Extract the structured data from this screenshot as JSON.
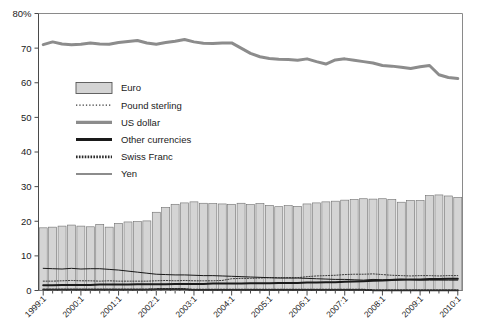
{
  "chart_data": {
    "type": "bar",
    "title": "",
    "subtitle": "",
    "xlabel": "",
    "ylabel": "",
    "ylim": [
      0,
      80
    ],
    "ytick_values": [
      0,
      10,
      20,
      30,
      40,
      50,
      60,
      70,
      80
    ],
    "ytick_labels": [
      "0",
      "10",
      "20",
      "30",
      "40",
      "50",
      "60",
      "70",
      "80%"
    ],
    "grid": false,
    "legend_position": "upper-left-inside",
    "legend": [
      {
        "label": "Euro",
        "marker": "filled-bar",
        "color": "#d4d4d4"
      },
      {
        "label": "Pound sterling",
        "marker": "dotted-thin-line",
        "color": "#3a3a3a"
      },
      {
        "label": "US dollar",
        "marker": "thick-gray-line",
        "color": "#8c8c8c"
      },
      {
        "label": "Other currencies",
        "marker": "thick-black-line",
        "color": "#1a1a1a"
      },
      {
        "label": "Swiss Franc",
        "marker": "dotted-thick-line",
        "color": "#2b2b2b"
      },
      {
        "label": "Yen",
        "marker": "thin-black-line",
        "color": "#1a1a1a"
      }
    ],
    "x": [
      "1999:1",
      "1999:2",
      "1999:3",
      "1999:4",
      "2000:1",
      "2000:2",
      "2000:3",
      "2000:4",
      "2001:1",
      "2001:2",
      "2001:3",
      "2001:4",
      "2002:1",
      "2002:2",
      "2002:3",
      "2002:4",
      "2003:1",
      "2003:2",
      "2003:3",
      "2003:4",
      "2004:1",
      "2004:2",
      "2004:3",
      "2004:4",
      "2005:1",
      "2005:2",
      "2005:3",
      "2005:4",
      "2006:1",
      "2006:2",
      "2006:3",
      "2006:4",
      "2007:1",
      "2007:2",
      "2007:3",
      "2007:4",
      "2008:1",
      "2008:2",
      "2008:3",
      "2008:4",
      "2009:1",
      "2009:2",
      "2009:3",
      "2009:4",
      "2010:1"
    ],
    "xtick_labels": [
      "1999:1",
      "2000:1",
      "2001:1",
      "2002:1",
      "2003:1",
      "2004:1",
      "2005:1",
      "2006:1",
      "2007:1",
      "2008:1",
      "2009:1",
      "2010:1"
    ],
    "xtick_label_rotation": -45,
    "series": [
      {
        "name": "Euro",
        "kind": "bar",
        "color": "#d4d4d4",
        "values": [
          18.1,
          18.3,
          18.6,
          18.9,
          18.6,
          18.4,
          19.1,
          18.3,
          19.4,
          19.8,
          19.9,
          20.1,
          22.6,
          24.0,
          24.9,
          25.3,
          25.6,
          25.2,
          25.1,
          25.0,
          24.9,
          25.2,
          24.8,
          25.1,
          24.6,
          24.2,
          24.5,
          24.3,
          25.0,
          25.3,
          25.6,
          25.8,
          26.1,
          26.3,
          26.5,
          26.4,
          26.5,
          26.3,
          25.5,
          26.0,
          26.0,
          27.4,
          27.6,
          27.3,
          26.9
        ]
      },
      {
        "name": "Pound sterling",
        "kind": "line",
        "color": "#3a3a3a",
        "style": "dotted",
        "width": 1,
        "values": [
          2.7,
          2.7,
          2.8,
          2.9,
          2.8,
          2.8,
          2.7,
          2.8,
          2.7,
          2.7,
          2.7,
          2.7,
          2.8,
          2.9,
          2.8,
          2.9,
          2.8,
          2.8,
          2.8,
          2.9,
          3.4,
          3.5,
          3.5,
          3.6,
          3.7,
          3.7,
          3.7,
          3.7,
          4.0,
          4.2,
          4.3,
          4.4,
          4.6,
          4.7,
          4.7,
          4.8,
          4.6,
          4.4,
          4.3,
          4.2,
          4.3,
          4.3,
          4.2,
          4.3,
          4.3
        ]
      },
      {
        "name": "US dollar",
        "kind": "line",
        "color": "#8c8c8c",
        "style": "solid",
        "width": 3,
        "values": [
          71.0,
          71.8,
          71.2,
          71.0,
          71.1,
          71.5,
          71.2,
          71.1,
          71.6,
          71.9,
          72.2,
          71.5,
          71.1,
          71.6,
          72.0,
          72.5,
          71.8,
          71.4,
          71.3,
          71.5,
          71.5,
          70.0,
          68.5,
          67.5,
          67.0,
          66.8,
          66.7,
          66.5,
          66.9,
          66.1,
          65.4,
          66.6,
          66.9,
          66.5,
          66.1,
          65.7,
          65.0,
          64.8,
          64.5,
          64.1,
          64.6,
          65.0,
          62.3,
          61.5,
          61.2
        ]
      },
      {
        "name": "Other currencies",
        "kind": "line",
        "color": "#1a1a1a",
        "style": "solid",
        "width": 2,
        "values": [
          1.5,
          1.5,
          1.6,
          1.6,
          1.6,
          1.6,
          1.7,
          1.7,
          1.7,
          1.7,
          1.8,
          1.8,
          1.8,
          1.8,
          1.9,
          1.9,
          1.9,
          1.9,
          2.0,
          2.0,
          2.0,
          2.0,
          2.1,
          2.1,
          2.1,
          2.2,
          2.2,
          2.2,
          2.3,
          2.3,
          2.4,
          2.4,
          2.5,
          2.6,
          2.7,
          2.8,
          2.9,
          3.0,
          3.1,
          3.2,
          3.2,
          3.3,
          3.3,
          3.4,
          3.4
        ]
      },
      {
        "name": "Swiss Franc",
        "kind": "line",
        "color": "#2b2b2b",
        "style": "dotted",
        "width": 2,
        "values": [
          0.3,
          0.3,
          0.3,
          0.3,
          0.3,
          0.3,
          0.3,
          0.3,
          0.3,
          0.3,
          0.3,
          0.3,
          0.4,
          0.4,
          0.4,
          0.4,
          0.2,
          0.2,
          0.2,
          0.2,
          0.2,
          0.2,
          0.2,
          0.2,
          0.2,
          0.2,
          0.2,
          0.2,
          0.2,
          0.2,
          0.2,
          0.2,
          0.2,
          0.2,
          0.2,
          0.1,
          0.1,
          0.1,
          0.1,
          0.1,
          0.1,
          0.1,
          0.1,
          0.1,
          0.1
        ]
      },
      {
        "name": "Yen",
        "kind": "line",
        "color": "#1a1a1a",
        "style": "solid",
        "width": 1,
        "values": [
          6.4,
          6.3,
          6.2,
          6.4,
          6.2,
          6.3,
          6.3,
          6.1,
          5.9,
          5.6,
          5.3,
          5.0,
          4.7,
          4.6,
          4.5,
          4.5,
          4.4,
          4.3,
          4.3,
          4.2,
          4.1,
          4.0,
          3.9,
          3.8,
          3.7,
          3.6,
          3.6,
          3.6,
          3.5,
          3.4,
          3.3,
          3.2,
          3.2,
          3.1,
          3.0,
          3.2,
          3.1,
          3.2,
          3.3,
          3.1,
          3.0,
          3.0,
          3.0,
          3.0,
          3.0
        ]
      }
    ]
  }
}
